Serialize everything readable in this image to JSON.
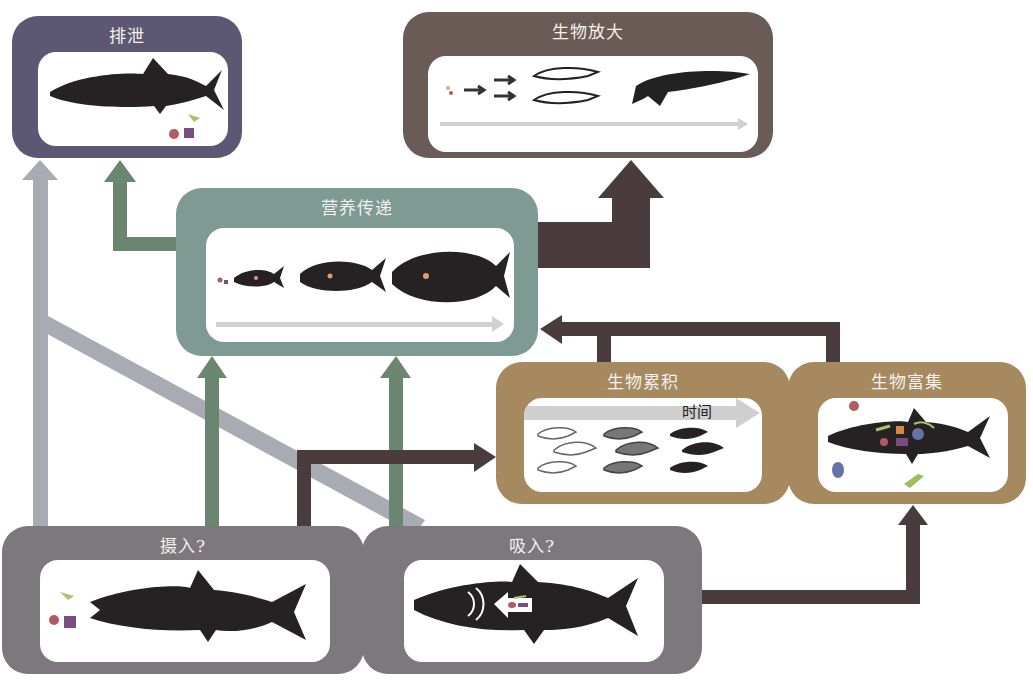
{
  "diagram": {
    "boxes": {
      "excretion": {
        "title": "排泄",
        "color": "#5c5873"
      },
      "biomagnification": {
        "title": "生物放大",
        "color": "#6b5b57"
      },
      "trophic_transfer": {
        "title": "营养传递",
        "color": "#7f9a93"
      },
      "bioaccumulation": {
        "title": "生物累积",
        "color": "#a6895e",
        "time_label": "时间"
      },
      "bioconcentration": {
        "title": "生物富集",
        "color": "#a6895e"
      },
      "ingestion": {
        "title": "摄入?",
        "color": "#7d787e"
      },
      "inhalation": {
        "title": "吸入?",
        "color": "#7d787e"
      }
    },
    "arrow_colors": {
      "light_gray": "#a8abb3",
      "green": "#6b8670",
      "dark_brown": "#4a3c3c"
    },
    "connections": [
      {
        "from": "摄入?",
        "to": "排泄",
        "color": "light_gray"
      },
      {
        "from": "营养传递",
        "to": "排泄",
        "color": "green"
      },
      {
        "from": "营养传递",
        "to": "生物放大",
        "color": "dark_brown"
      },
      {
        "from": "摄入?",
        "to": "营养传递",
        "color": "green"
      },
      {
        "from": "吸入?",
        "to": "营养传递",
        "color": "green"
      },
      {
        "from": "摄入?",
        "to": "生物累积",
        "color": "dark_brown"
      },
      {
        "from": "生物累积",
        "to": "营养传递",
        "color": "dark_brown"
      },
      {
        "from": "生物富集",
        "to": "营养传递",
        "color": "dark_brown"
      },
      {
        "from": "吸入?",
        "to": "生物富集",
        "color": "dark_brown"
      },
      {
        "from": "排泄",
        "to": "吸入?",
        "color": "light_gray"
      }
    ]
  }
}
